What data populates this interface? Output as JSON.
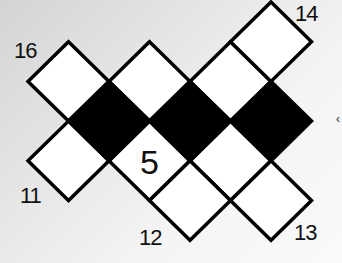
{
  "puzzle": {
    "grid": {
      "origin_x": 28,
      "origin_y": 2,
      "step_x": 40.5,
      "step_y": 39.7,
      "cells": [
        {
          "c": 1,
          "r": 2,
          "color": "white",
          "value": ""
        },
        {
          "c": 3,
          "r": 2,
          "color": "white",
          "value": ""
        },
        {
          "c": 5,
          "r": 2,
          "color": "white",
          "value": ""
        },
        {
          "c": 6,
          "r": 1,
          "color": "white",
          "value": ""
        },
        {
          "c": 2,
          "r": 3,
          "color": "black",
          "value": ""
        },
        {
          "c": 4,
          "r": 3,
          "color": "black",
          "value": ""
        },
        {
          "c": 6,
          "r": 3,
          "color": "black",
          "value": ""
        },
        {
          "c": 1,
          "r": 4,
          "color": "white",
          "value": ""
        },
        {
          "c": 3,
          "r": 4,
          "color": "white",
          "value": "5"
        },
        {
          "c": 5,
          "r": 4,
          "color": "white",
          "value": ""
        },
        {
          "c": 4,
          "r": 5,
          "color": "white",
          "value": ""
        },
        {
          "c": 6,
          "r": 5,
          "color": "white",
          "value": ""
        }
      ]
    },
    "clues": [
      {
        "label": "16",
        "x": 14,
        "y": 40
      },
      {
        "label": "14",
        "x": 295,
        "y": 3
      },
      {
        "label": "11",
        "x": 20,
        "y": 185
      },
      {
        "label": "12",
        "x": 139,
        "y": 227
      },
      {
        "label": "13",
        "x": 294,
        "y": 222
      }
    ],
    "given_value": "5",
    "edge_glyph": "‹"
  }
}
